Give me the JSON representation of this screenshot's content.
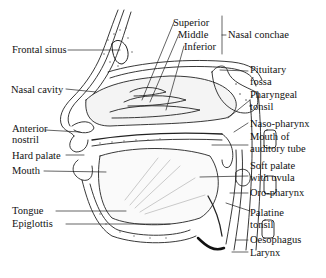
{
  "diagram": {
    "type": "anatomical-cross-section",
    "labels_left": [
      {
        "id": "frontal-sinus",
        "text": "Frontal sinus"
      },
      {
        "id": "nasal-cavity",
        "text": "Nasal cavity"
      },
      {
        "id": "anterior-nostril-1",
        "text": "Anterior"
      },
      {
        "id": "anterior-nostril-2",
        "text": "nostril"
      },
      {
        "id": "hard-palate",
        "text": "Hard palate"
      },
      {
        "id": "mouth",
        "text": "Mouth"
      },
      {
        "id": "tongue",
        "text": "Tongue"
      },
      {
        "id": "epiglottis",
        "text": "Epiglottis"
      }
    ],
    "conchae": {
      "superior": "Superior",
      "middle": "Middle",
      "inferior": "Inferior",
      "group_label": "Nasal conchae"
    },
    "labels_right": [
      {
        "id": "pituitary-fossa-1",
        "text": "Pituitary"
      },
      {
        "id": "pituitary-fossa-2",
        "text": "fossa"
      },
      {
        "id": "pharyngeal-tonsil-1",
        "text": "Pharyngeal"
      },
      {
        "id": "pharyngeal-tonsil-2",
        "text": "tonsil"
      },
      {
        "id": "naso-pharynx",
        "text": "Naso-pharynx"
      },
      {
        "id": "auditory-tube-1",
        "text": "Mouth of"
      },
      {
        "id": "auditory-tube-2",
        "text": "auditory tube"
      },
      {
        "id": "soft-palate-1",
        "text": "Soft palate"
      },
      {
        "id": "soft-palate-2",
        "text": "with uvula"
      },
      {
        "id": "oro-pharynx",
        "text": "Oro-pharynx"
      },
      {
        "id": "palatine-tonsil-1",
        "text": "Palatine"
      },
      {
        "id": "palatine-tonsil-2",
        "text": "tonsil"
      },
      {
        "id": "oesophagus",
        "text": "Oesophagus"
      },
      {
        "id": "larynx",
        "text": "Larynx"
      }
    ]
  }
}
